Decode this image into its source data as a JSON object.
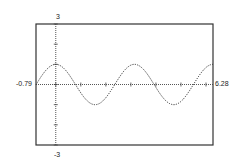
{
  "chart_data": {
    "type": "line",
    "title": "",
    "function": "y = cos(2x)",
    "xlabel": "",
    "ylabel": "",
    "xlim": [
      -0.79,
      6.28
    ],
    "ylim": [
      -3,
      3
    ],
    "grid": false,
    "legend": null,
    "x_tick_step": 1,
    "y_tick_step": 1,
    "labels": {
      "xmin": "-0.79",
      "xmax": "6.28",
      "ymax": "3",
      "ymin": "-3"
    },
    "series": [
      {
        "name": "cos(2x)",
        "style": "dotted",
        "x": [
          -0.79,
          0,
          0.785,
          1.571,
          2.356,
          3.142,
          3.927,
          4.712,
          5.498,
          6.28
        ],
        "y": [
          0.0,
          1.0,
          0.0,
          -1.0,
          0.0,
          1.0,
          0.0,
          -1.0,
          0.0,
          1.0
        ]
      }
    ]
  },
  "colors": {
    "frame": "#333333",
    "curve": "#333333",
    "axis": "#444444"
  }
}
